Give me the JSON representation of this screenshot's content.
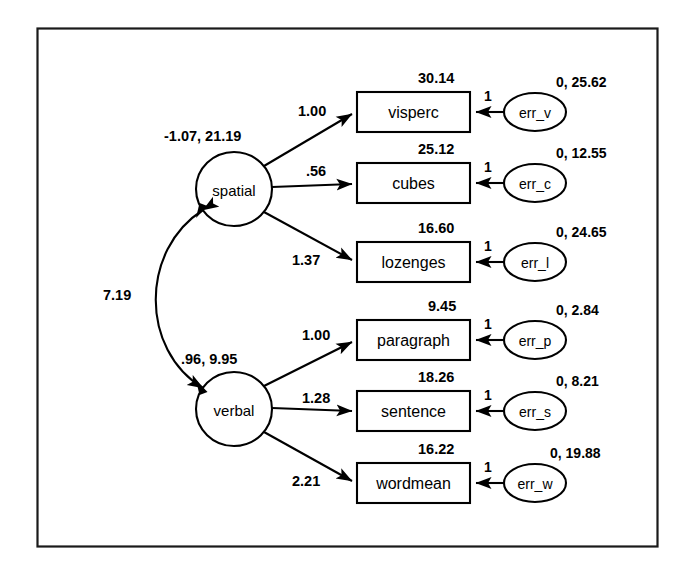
{
  "diagram": {
    "border_color": "#1a1a1a",
    "background": "#ffffff",
    "stroke_color": "#000000"
  },
  "factors": [
    {
      "id": "spatial",
      "label": "spatial",
      "mean_variance": "-1.07, 21.19",
      "cx": 234,
      "cy": 189,
      "rx": 38,
      "ry": 37
    },
    {
      "id": "verbal",
      "label": "verbal",
      "mean_variance": ".96, 9.95",
      "cx": 234,
      "cy": 409,
      "rx": 38,
      "ry": 37
    }
  ],
  "covariance": {
    "label": "7.19",
    "from": "spatial",
    "to": "verbal",
    "type": "double-headed-curved"
  },
  "indicators": [
    {
      "id": "visperc",
      "label": "visperc",
      "intercept": "30.14",
      "loading": "1.00",
      "factor": "spatial",
      "y": 112
    },
    {
      "id": "cubes",
      "label": "cubes",
      "intercept": "25.12",
      "loading": ".56",
      "factor": "spatial",
      "y": 183
    },
    {
      "id": "lozenges",
      "label": "lozenges",
      "intercept": "16.60",
      "loading": "1.37",
      "factor": "spatial",
      "y": 262
    },
    {
      "id": "paragraph",
      "label": "paragraph",
      "intercept": "9.45",
      "loading": "1.00",
      "factor": "verbal",
      "y": 340
    },
    {
      "id": "sentence",
      "label": "sentence",
      "intercept": "18.26",
      "loading": "1.28",
      "factor": "verbal",
      "y": 411
    },
    {
      "id": "wordmean",
      "label": "wordmean",
      "intercept": "16.22",
      "loading": "2.21",
      "factor": "verbal",
      "y": 483
    }
  ],
  "errors": [
    {
      "id": "err_v",
      "label": "err_v",
      "mean_variance": "0, 25.62",
      "path_label": "1",
      "target": "visperc",
      "y": 112
    },
    {
      "id": "err_c",
      "label": "err_c",
      "mean_variance": "0, 12.55",
      "path_label": "1",
      "target": "cubes",
      "y": 183
    },
    {
      "id": "err_l",
      "label": "err_l",
      "mean_variance": "0, 24.65",
      "path_label": "1",
      "target": "lozenges",
      "y": 262
    },
    {
      "id": "err_p",
      "label": "err_p",
      "mean_variance": "0, 2.84",
      "path_label": "1",
      "target": "paragraph",
      "y": 340
    },
    {
      "id": "err_s",
      "label": "err_s",
      "mean_variance": "0, 8.21",
      "path_label": "1",
      "target": "sentence",
      "y": 411
    },
    {
      "id": "err_w",
      "label": "err_w",
      "mean_variance": "0, 19.88",
      "path_label": "1",
      "target": "wordmean",
      "y": 483
    }
  ]
}
